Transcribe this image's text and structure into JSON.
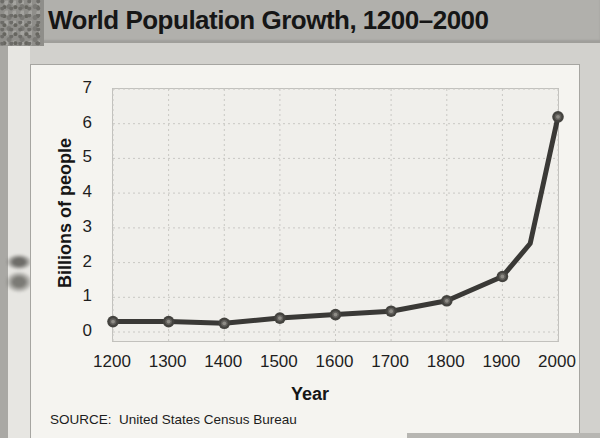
{
  "page": {
    "title": "World Population Growth, 1200–2000",
    "source": "SOURCE:  United States Census Bureau"
  },
  "chart_data": {
    "type": "line",
    "title": "World Population Growth, 1200–2000",
    "xlabel": "Year",
    "ylabel": "Billions of people",
    "xlim": [
      1200,
      2000
    ],
    "ylim": [
      0,
      7
    ],
    "x_ticks": [
      1200,
      1300,
      1400,
      1500,
      1600,
      1700,
      1800,
      1900,
      2000
    ],
    "y_ticks": [
      0,
      1,
      2,
      3,
      4,
      5,
      6,
      7
    ],
    "grid": true,
    "grid_style": "dashed",
    "legend": "none",
    "line_color": "#3a3936",
    "marker_fill": "#44433f",
    "marker_highlight": "#8e8c86",
    "series": [
      {
        "name": "World population (billions)",
        "points": [
          {
            "year": 1200,
            "value": 0.3,
            "marker": true
          },
          {
            "year": 1300,
            "value": 0.3,
            "marker": true
          },
          {
            "year": 1400,
            "value": 0.25,
            "marker": true
          },
          {
            "year": 1500,
            "value": 0.4,
            "marker": true
          },
          {
            "year": 1600,
            "value": 0.5,
            "marker": true
          },
          {
            "year": 1700,
            "value": 0.6,
            "marker": true
          },
          {
            "year": 1800,
            "value": 0.9,
            "marker": true
          },
          {
            "year": 1900,
            "value": 1.6,
            "marker": true
          },
          {
            "year": 1950,
            "value": 2.55,
            "marker": false
          },
          {
            "year": 2000,
            "value": 6.2,
            "marker": true
          }
        ]
      }
    ]
  }
}
